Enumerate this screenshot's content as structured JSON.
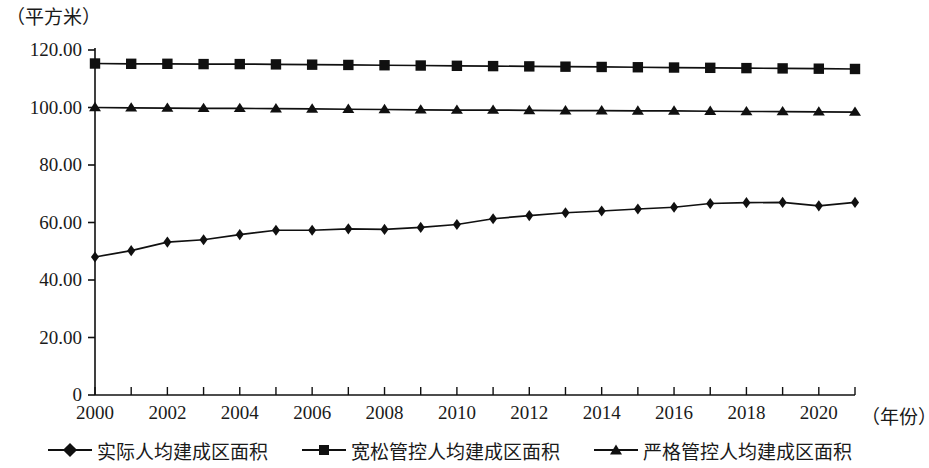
{
  "chart_data": {
    "type": "line",
    "title": "",
    "subtitle": "",
    "ylabel": "（平方米）",
    "xlabel": "（年份）",
    "grid": false,
    "legend_position": "bottom",
    "xlim": [
      2000,
      2021
    ],
    "ylim": [
      0,
      120
    ],
    "ytick_labels": [
      "0",
      "20.00",
      "40.00",
      "60.00",
      "80.00",
      "100.00",
      "120.00"
    ],
    "ytick_values": [
      0,
      20,
      40,
      60,
      80,
      100,
      120
    ],
    "xtick_labels": [
      "2000",
      "2002",
      "2004",
      "2006",
      "2008",
      "2010",
      "2012",
      "2014",
      "2016",
      "2018",
      "2020"
    ],
    "xtick_values": [
      2000,
      2002,
      2004,
      2006,
      2008,
      2010,
      2012,
      2014,
      2016,
      2018,
      2020
    ],
    "x": [
      2000,
      2001,
      2002,
      2003,
      2004,
      2005,
      2006,
      2007,
      2008,
      2009,
      2010,
      2011,
      2012,
      2013,
      2014,
      2015,
      2016,
      2017,
      2018,
      2019,
      2020,
      2021
    ],
    "series": [
      {
        "name": "实际人均建成区面积",
        "marker": "diamond",
        "color": "#101010",
        "values": [
          48.0,
          50.2,
          53.2,
          54.0,
          55.8,
          57.3,
          57.3,
          57.8,
          57.6,
          58.3,
          59.3,
          61.3,
          62.4,
          63.4,
          64.0,
          64.7,
          65.3,
          66.6,
          66.9,
          67.0,
          65.8,
          67.0
        ]
      },
      {
        "name": "宽松管控人均建成区面积",
        "marker": "square",
        "color": "#101010",
        "values": [
          115.3,
          115.2,
          115.2,
          115.1,
          115.1,
          115.0,
          114.9,
          114.8,
          114.7,
          114.6,
          114.5,
          114.4,
          114.3,
          114.2,
          114.1,
          114.0,
          113.9,
          113.8,
          113.7,
          113.6,
          113.5,
          113.4
        ]
      },
      {
        "name": "严格管控人均建成区面积",
        "marker": "triangle",
        "color": "#101010",
        "values": [
          100.0,
          99.9,
          99.8,
          99.7,
          99.7,
          99.6,
          99.5,
          99.4,
          99.3,
          99.2,
          99.1,
          99.1,
          99.0,
          98.9,
          98.9,
          98.8,
          98.8,
          98.7,
          98.6,
          98.6,
          98.5,
          98.4
        ]
      }
    ]
  },
  "legend": {
    "items": [
      {
        "label": "实际人均建成区面积",
        "marker": "diamond"
      },
      {
        "label": "宽松管控人均建成区面积",
        "marker": "square"
      },
      {
        "label": "严格管控人均建成区面积",
        "marker": "triangle"
      }
    ]
  }
}
